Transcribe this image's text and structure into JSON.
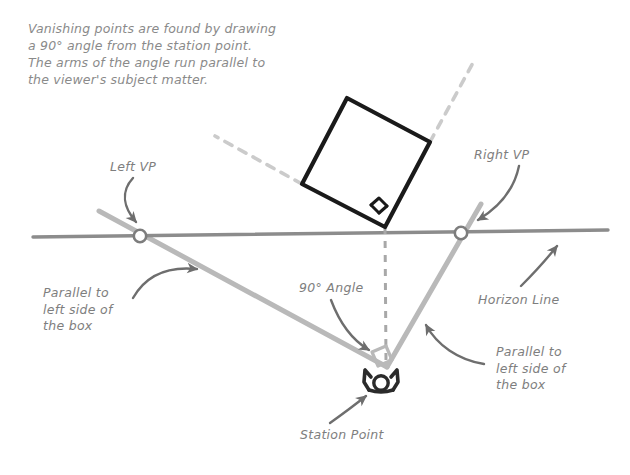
{
  "diagram": {
    "title_note": "Vanishing points are found by drawing\na 90° angle from the station point.\nThe arms of the angle run parallel to\nthe viewer's subject matter.",
    "labels": {
      "left_vp": "Left VP",
      "right_vp": "Right VP",
      "parallel_left": "Parallel to\nleft side of\nthe box",
      "parallel_right": "Parallel to\nleft side of\nthe box",
      "horizon_line": "Horizon Line",
      "angle": "90° Angle",
      "station_point": "Station Point"
    },
    "colors": {
      "text": "#8a8a8a",
      "box_stroke": "#1a1a1a",
      "horizon": "#8c8c8c",
      "sight_line": "#b4b4b4",
      "dashed": "#c9c9c9",
      "arrow": "#6e6e6e",
      "figure": "#2b2b2b",
      "vp_fill": "#ffffff",
      "background": "#ffffff"
    },
    "geometry": {
      "horizon_line": {
        "x1": 33,
        "y1": 237,
        "x2": 608,
        "y2": 230
      },
      "left_vp_point": {
        "x": 140,
        "y": 236
      },
      "right_vp_point": {
        "x": 461,
        "y": 233
      },
      "station_point": {
        "x": 387,
        "y": 367
      },
      "box_corners": [
        {
          "x": 302,
          "y": 184
        },
        {
          "x": 347,
          "y": 98
        },
        {
          "x": 430,
          "y": 142
        },
        {
          "x": 385,
          "y": 227
        }
      ],
      "angle_degrees": 90,
      "plumb_line": {
        "x1": 385,
        "y1": 227,
        "x2": 386,
        "y2": 360
      },
      "dashed_extension_left": {
        "x1": 302,
        "y1": 184,
        "x2": 215,
        "y2": 136
      },
      "dashed_extension_right": {
        "x1": 430,
        "y1": 142,
        "x2": 474,
        "y2": 61
      },
      "sight_line_left": {
        "x1": 101,
        "y1": 212,
        "x2": 387,
        "y2": 367
      },
      "sight_line_right": {
        "x1": 387,
        "y1": 367,
        "x2": 479,
        "y2": 206
      }
    }
  }
}
